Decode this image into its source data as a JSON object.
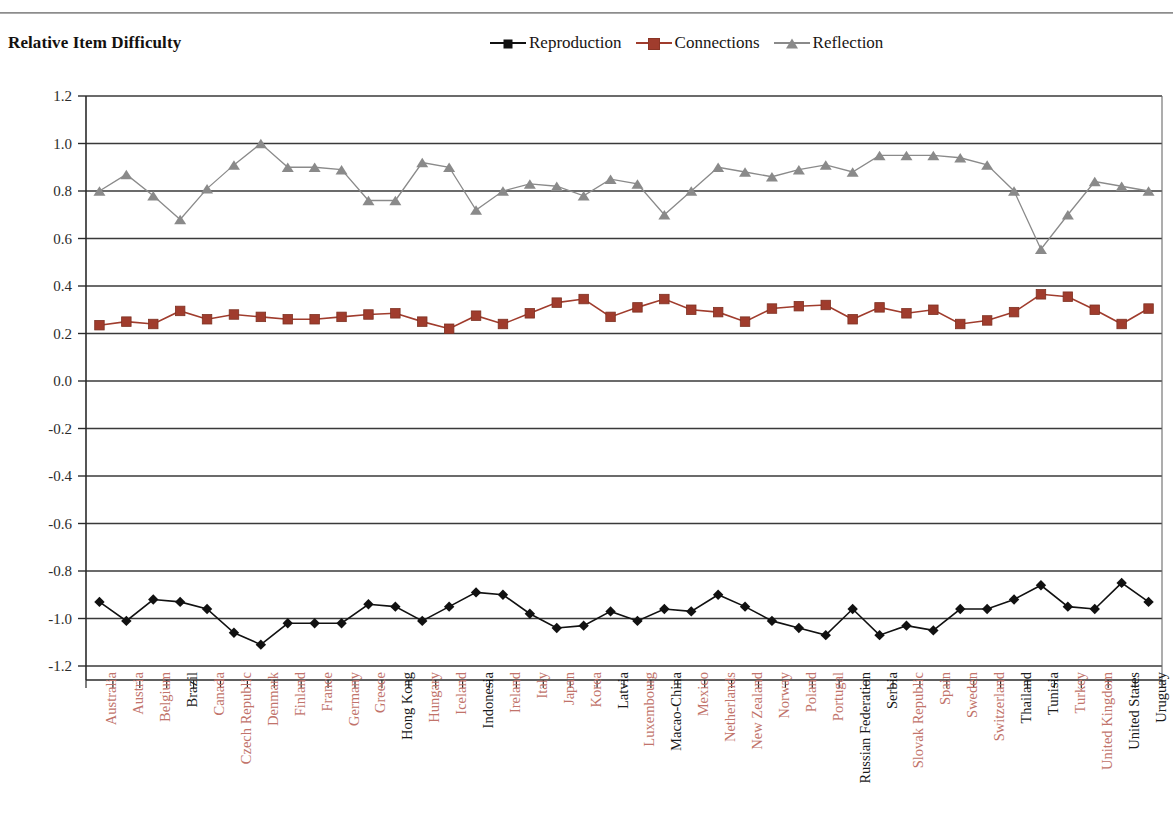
{
  "page": {
    "cut_header_text": "",
    "title": "Relative Item Difficulty"
  },
  "legend": {
    "position": "top-center",
    "entries": [
      {
        "label": "Reproduction",
        "marker": "diamond-icon",
        "color": "#111111"
      },
      {
        "label": "Connections",
        "marker": "square-icon",
        "color": "#a03c2d"
      },
      {
        "label": "Reflection",
        "marker": "triangle-icon",
        "color": "#8a8a8a"
      }
    ]
  },
  "axis": {
    "y_ticks": [
      "1.2",
      "1.0",
      "0.8",
      "0.6",
      "0.4",
      "0.2",
      "0.0",
      "-0.2",
      "-0.4",
      "-0.6",
      "-0.8",
      "-1.0",
      "-1.2"
    ]
  },
  "chart_data": {
    "type": "line",
    "title": "Relative Item Difficulty",
    "xlabel": "",
    "ylabel": "",
    "ylim": [
      -1.2,
      1.2
    ],
    "ytick_step": 0.2,
    "grid": true,
    "legend_position": "top-center",
    "categories": [
      "Australia",
      "Austria",
      "Belgium",
      "Brazil",
      "Canada",
      "Czech Republic",
      "Denmark",
      "Finland",
      "France",
      "Germany",
      "Greece",
      "Hong Kong",
      "Hungary",
      "Iceland",
      "Indonesia",
      "Ireland",
      "Italy",
      "Japan",
      "Korea",
      "Latvia",
      "Luxembourg",
      "Macao-China",
      "Mexico",
      "Netherlands",
      "New Zealand",
      "Norway",
      "Poland",
      "Portugal",
      "Russian Federation",
      "Serbia",
      "Slovak Republic",
      "Spain",
      "Sweden",
      "Switzerland",
      "Thailand",
      "Tunisia",
      "Turkey",
      "United Kingdom",
      "United States",
      "Uruguay"
    ],
    "category_groups": [
      "oecd",
      "oecd",
      "oecd",
      "partner",
      "oecd",
      "oecd",
      "oecd",
      "oecd",
      "oecd",
      "oecd",
      "oecd",
      "partner",
      "oecd",
      "oecd",
      "partner",
      "oecd",
      "oecd",
      "oecd",
      "oecd",
      "partner",
      "oecd",
      "partner",
      "oecd",
      "oecd",
      "oecd",
      "oecd",
      "oecd",
      "oecd",
      "partner",
      "partner",
      "oecd",
      "oecd",
      "oecd",
      "oecd",
      "partner",
      "partner",
      "oecd",
      "oecd",
      "partner",
      "partner"
    ],
    "series": [
      {
        "name": "Reproduction",
        "marker": "diamond",
        "color": "#111111",
        "values": [
          -0.93,
          -1.01,
          -0.92,
          -0.93,
          -0.96,
          -1.06,
          -1.11,
          -1.02,
          -1.02,
          -1.02,
          -0.94,
          -0.95,
          -1.01,
          -0.95,
          -0.89,
          -0.9,
          -0.98,
          -1.04,
          -1.03,
          -0.97,
          -1.01,
          -0.96,
          -0.97,
          -0.9,
          -0.95,
          -1.01,
          -1.04,
          -1.07,
          -0.96,
          -1.07,
          -1.03,
          -1.05,
          -0.96,
          -0.96,
          -0.92,
          -0.86,
          -0.95,
          -0.96,
          -0.85,
          -0.93
        ]
      },
      {
        "name": "Connections",
        "marker": "square",
        "color": "#a03c2d",
        "values": [
          0.235,
          0.25,
          0.24,
          0.295,
          0.26,
          0.28,
          0.27,
          0.26,
          0.26,
          0.27,
          0.28,
          0.285,
          0.25,
          0.22,
          0.275,
          0.24,
          0.285,
          0.33,
          0.345,
          0.27,
          0.31,
          0.345,
          0.3,
          0.29,
          0.25,
          0.305,
          0.315,
          0.32,
          0.26,
          0.31,
          0.285,
          0.3,
          0.24,
          0.255,
          0.29,
          0.365,
          0.355,
          0.3,
          0.24,
          0.305
        ]
      },
      {
        "name": "Reflection",
        "marker": "triangle",
        "color": "#8a8a8a",
        "values": [
          0.8,
          0.87,
          0.78,
          0.68,
          0.81,
          0.91,
          1.0,
          0.9,
          0.9,
          0.89,
          0.76,
          0.76,
          0.92,
          0.9,
          0.72,
          0.8,
          0.83,
          0.82,
          0.78,
          0.85,
          0.83,
          0.7,
          0.8,
          0.9,
          0.88,
          0.86,
          0.89,
          0.91,
          0.88,
          0.95,
          0.95,
          0.95,
          0.94,
          0.91,
          0.8,
          0.555,
          0.7,
          0.84,
          0.82,
          0.8
        ]
      }
    ]
  }
}
